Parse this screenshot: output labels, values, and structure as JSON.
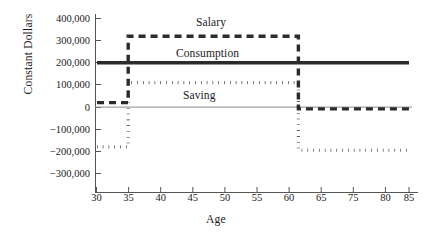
{
  "chart_data": {
    "type": "line",
    "title": "",
    "xlabel": "Age",
    "ylabel": "Constant Dollars",
    "xlim": [
      30,
      85
    ],
    "ylim": [
      -330000,
      420000
    ],
    "grid": false,
    "legend_position": "inline-annotations",
    "x_ticks": [
      30,
      35,
      40,
      45,
      50,
      55,
      60,
      65,
      70,
      75,
      80,
      85
    ],
    "x_tick_labels": [
      "30",
      "35",
      "40",
      "45",
      "50",
      "55",
      "60",
      "65",
      "75",
      "80",
      "85"
    ],
    "y_ticks": [
      400000,
      300000,
      200000,
      100000,
      0,
      -100000,
      -200000,
      -300000
    ],
    "y_tick_labels": [
      "400,000",
      "300,000",
      "200,000",
      "100,000",
      "0",
      "−100,000",
      "−200,000",
      "−300,000"
    ],
    "zero_reference_line": 0,
    "series": [
      {
        "name": "Salary",
        "style": "dashed",
        "width": 3.2,
        "color": "#2b2b2b",
        "label_x": 51,
        "label_y": 370000,
        "x": [
          30,
          35.5,
          35.5,
          65.5,
          65.5,
          85
        ],
        "values": [
          20000,
          20000,
          320000,
          320000,
          -8000,
          -8000
        ]
      },
      {
        "name": "Consumption",
        "style": "solid",
        "width": 3.2,
        "color": "#2b2b2b",
        "label_x": 48,
        "label_y": 248000,
        "x": [
          30,
          85
        ],
        "values": [
          200000,
          200000
        ]
      },
      {
        "name": "Saving",
        "style": "dotted",
        "width": 3.2,
        "color": "#2b2b2b",
        "label_x": 45.5,
        "label_y": 55000,
        "x": [
          30,
          35.5,
          35.5,
          65.5,
          65.5,
          85
        ],
        "values": [
          -180000,
          -180000,
          110000,
          110000,
          -195000,
          -195000
        ]
      }
    ]
  },
  "axes": {
    "y_title": "Constant Dollars",
    "x_title": "Age",
    "y_labels": [
      "400,000",
      "300,000",
      "200,000",
      "100,000",
      "0",
      "−100,000",
      "−200,000",
      "−300,000"
    ],
    "x_labels": [
      "30",
      "35",
      "40",
      "45",
      "50",
      "55",
      "60",
      "65",
      "75",
      "80",
      "85"
    ]
  },
  "annotations": {
    "salary": "Salary",
    "consumption": "Consumption",
    "saving": "Saving"
  },
  "colors": {
    "line": "#2b2b2b",
    "axis": "#555555",
    "zero_line": "#777777",
    "background": "#ffffff"
  }
}
